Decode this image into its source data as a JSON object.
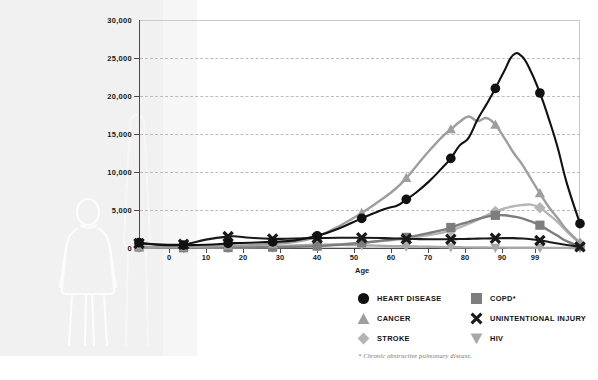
{
  "chart_data": {
    "type": "line",
    "title": "",
    "xlabel": "Age",
    "ylabel": "",
    "xlim": [
      0,
      99
    ],
    "ylim": [
      0,
      30000
    ],
    "grid": true,
    "legend_position": "bottom-right",
    "x_ticks": [
      "0",
      "10",
      "20",
      "30",
      "40",
      "50",
      "60",
      "70",
      "80",
      "90",
      "99"
    ],
    "x_tick_values": [
      0,
      10,
      20,
      30,
      40,
      50,
      60,
      70,
      80,
      90,
      99
    ],
    "y_ticks": [
      "0",
      "5,000",
      "10,000",
      "15,000",
      "20,000",
      "25,000",
      "30,000"
    ],
    "y_tick_values": [
      0,
      5000,
      10000,
      15000,
      20000,
      25000,
      30000
    ],
    "x": [
      0,
      5,
      10,
      15,
      20,
      22,
      25,
      30,
      35,
      40,
      45,
      50,
      55,
      58,
      60,
      62,
      65,
      68,
      70,
      72,
      74,
      76,
      78,
      80,
      82,
      84,
      86,
      88,
      90,
      92,
      94,
      96,
      99
    ],
    "series": [
      {
        "name": "HEART DISEASE",
        "marker": "circle",
        "color": "#111111",
        "values": [
          700,
          400,
          380,
          420,
          600,
          650,
          700,
          800,
          1000,
          1600,
          2600,
          3900,
          5100,
          5600,
          6400,
          7200,
          8700,
          10500,
          11800,
          13500,
          14500,
          16900,
          18900,
          21000,
          23300,
          25400,
          25200,
          23200,
          20400,
          17000,
          13200,
          8600,
          3200
        ]
      },
      {
        "name": "CANCER",
        "marker": "triangle-up",
        "color": "#9e9e9e",
        "values": [
          200,
          130,
          150,
          200,
          300,
          330,
          380,
          520,
          800,
          1500,
          2900,
          4600,
          6600,
          8000,
          9200,
          10600,
          12700,
          14600,
          15600,
          16600,
          17300,
          16700,
          17100,
          16200,
          14500,
          12600,
          11000,
          9100,
          7200,
          5400,
          3900,
          2400,
          700
        ]
      },
      {
        "name": "STROKE",
        "marker": "diamond",
        "color": "#b5b5b5",
        "values": [
          120,
          60,
          60,
          70,
          90,
          95,
          110,
          140,
          200,
          300,
          480,
          700,
          950,
          1100,
          1250,
          1420,
          1700,
          2000,
          2300,
          2700,
          3200,
          3700,
          4300,
          4800,
          5200,
          5500,
          5650,
          5700,
          5300,
          4400,
          3400,
          2200,
          600
        ]
      },
      {
        "name": "COPD*",
        "marker": "square",
        "color": "#7d7d7d",
        "values": [
          130,
          50,
          40,
          45,
          60,
          65,
          80,
          110,
          160,
          250,
          430,
          680,
          1000,
          1200,
          1400,
          1600,
          1950,
          2350,
          2700,
          3100,
          3450,
          3800,
          4100,
          4300,
          4300,
          4150,
          3900,
          3500,
          3000,
          2300,
          1600,
          900,
          200
        ]
      },
      {
        "name": "UNINTENTIONAL INJURY",
        "marker": "x",
        "color": "#1a1a1a",
        "values": [
          600,
          450,
          480,
          1100,
          1500,
          1520,
          1350,
          1200,
          1250,
          1300,
          1350,
          1350,
          1300,
          1250,
          1200,
          1180,
          1150,
          1150,
          1150,
          1180,
          1200,
          1230,
          1250,
          1280,
          1300,
          1300,
          1250,
          1150,
          1000,
          800,
          600,
          400,
          150
        ]
      },
      {
        "name": "HIV",
        "marker": "triangle-down",
        "color": "#a8a8a8",
        "values": [
          60,
          30,
          25,
          30,
          60,
          70,
          110,
          210,
          340,
          430,
          420,
          360,
          280,
          240,
          210,
          190,
          160,
          130,
          110,
          95,
          80,
          70,
          60,
          50,
          45,
          40,
          35,
          30,
          25,
          20,
          15,
          10,
          5
        ]
      }
    ],
    "legend": [
      {
        "label": "HEART DISEASE",
        "marker": "circle",
        "color": "#111111"
      },
      {
        "label": "CANCER",
        "marker": "triangle-up",
        "color": "#9e9e9e"
      },
      {
        "label": "STROKE",
        "marker": "diamond",
        "color": "#b5b5b5"
      },
      {
        "label": "COPD*",
        "marker": "square",
        "color": "#7d7d7d"
      },
      {
        "label": "UNINTENTIONAL INJURY",
        "marker": "x",
        "color": "#1a1a1a"
      },
      {
        "label": "HIV",
        "marker": "triangle-down",
        "color": "#a8a8a8"
      }
    ],
    "footnote": "* Chronic obstructive pulmonary disease."
  },
  "colors": {
    "axis": "#4a4a4a",
    "grid": "#bdbdbd",
    "text": "#111111",
    "panel": "#f1f1f1"
  }
}
